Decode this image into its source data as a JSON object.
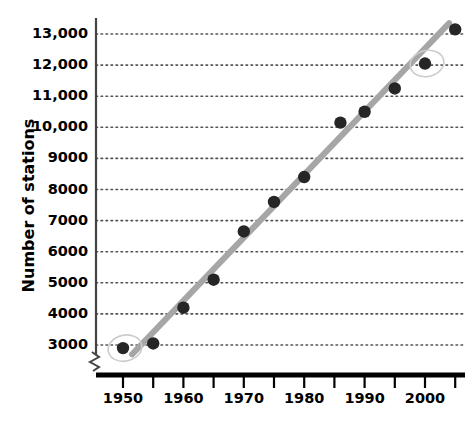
{
  "chart_data": {
    "type": "scatter",
    "title": "",
    "xlabel": "Year",
    "ylabel": "Number of stations",
    "xlim": [
      1947,
      2008
    ],
    "ylim": [
      2600,
      13400
    ],
    "grid": true,
    "grid_style": "dotted horizontal",
    "legend": "none",
    "axis_break": true,
    "x_tick_labels": [
      "1950",
      "1960",
      "1970",
      "1980",
      "1990",
      "2000"
    ],
    "x_tick_values": [
      1950,
      1960,
      1970,
      1980,
      1990,
      2000
    ],
    "x_minor_ticks": [
      1955,
      1965,
      1975,
      1985,
      1995,
      2005
    ],
    "y_tick_labels": [
      "3000",
      "4000",
      "5000",
      "6000",
      "7000",
      "8000",
      "9000",
      "10,000",
      "11,000",
      "12,000",
      "13,000"
    ],
    "y_tick_values": [
      3000,
      4000,
      5000,
      6000,
      7000,
      8000,
      9000,
      10000,
      11000,
      12000,
      13000
    ],
    "x": [
      1950,
      1955,
      1960,
      1965,
      1970,
      1975,
      1980,
      1986,
      1990,
      1995,
      2000,
      2005
    ],
    "values": [
      2900,
      3050,
      4200,
      5100,
      6650,
      7600,
      8400,
      10150,
      10500,
      11250,
      12050,
      13150
    ],
    "series": [
      {
        "name": "Number of stations",
        "marker": "filled-circle",
        "color": "#262626",
        "x": [
          1950,
          1955,
          1960,
          1965,
          1970,
          1975,
          1980,
          1986,
          1990,
          1995,
          2000,
          2005
        ],
        "values": [
          2900,
          3050,
          4200,
          5100,
          6650,
          7600,
          8400,
          10150,
          10500,
          11250,
          12050,
          13150
        ]
      },
      {
        "name": "trend line",
        "type": "line",
        "color": "#a6a6a6",
        "x": [
          1951.5,
          2004
        ],
        "values": [
          2700,
          13350
        ]
      }
    ],
    "annotations": [
      {
        "name": "circle-highlight-1950",
        "x": 1950,
        "y": 2900
      },
      {
        "name": "circle-highlight-2000",
        "x": 2000,
        "y": 12050
      }
    ],
    "colors": {
      "marker": "#262626",
      "trend_line": "#a6a6a6",
      "axis": "#000000",
      "grid": "#555555",
      "annotation": "#cccccc",
      "background": "#ffffff"
    }
  }
}
